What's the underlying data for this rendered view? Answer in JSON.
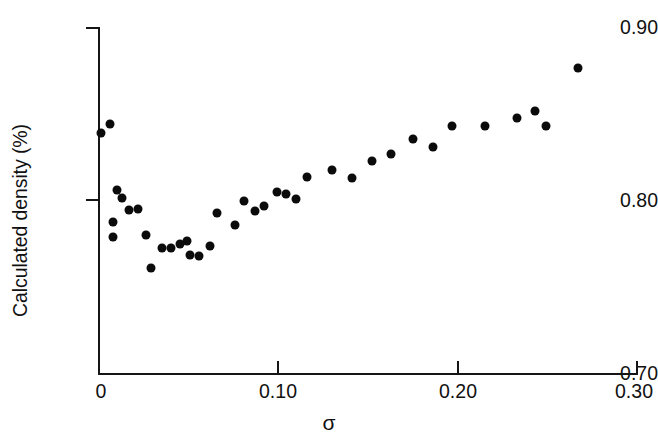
{
  "chart_data": {
    "type": "scatter",
    "title": "",
    "xlabel": "σ",
    "ylabel": "Calculated density (%)",
    "xlim": [
      0,
      0.3
    ],
    "ylim": [
      0.7,
      0.9
    ],
    "xticks": [
      0,
      0.1,
      0.2,
      0.3
    ],
    "xtick_labels": [
      "0",
      "0.10",
      "0.20",
      "0.30"
    ],
    "yticks": [
      0.7,
      0.8,
      0.9
    ],
    "ytick_labels": [
      "0.70",
      "0.80",
      "0.90"
    ],
    "grid": false,
    "legend": null,
    "marker": "filled-circle",
    "marker_color": "#0b0b0b",
    "marker_size_px": 9,
    "series": [
      {
        "name": "Calculated density vs sigma",
        "points": [
          {
            "x": 0.001,
            "y": 0.839
          },
          {
            "x": 0.006,
            "y": 0.844
          },
          {
            "x": 0.01,
            "y": 0.806
          },
          {
            "x": 0.013,
            "y": 0.801
          },
          {
            "x": 0.008,
            "y": 0.787
          },
          {
            "x": 0.017,
            "y": 0.794
          },
          {
            "x": 0.022,
            "y": 0.795
          },
          {
            "x": 0.008,
            "y": 0.7785
          },
          {
            "x": 0.026,
            "y": 0.7795
          },
          {
            "x": 0.029,
            "y": 0.7605
          },
          {
            "x": 0.035,
            "y": 0.7725
          },
          {
            "x": 0.04,
            "y": 0.7725
          },
          {
            "x": 0.045,
            "y": 0.7745
          },
          {
            "x": 0.049,
            "y": 0.7765
          },
          {
            "x": 0.051,
            "y": 0.7685
          },
          {
            "x": 0.056,
            "y": 0.7675
          },
          {
            "x": 0.062,
            "y": 0.7735
          },
          {
            "x": 0.066,
            "y": 0.7925
          },
          {
            "x": 0.076,
            "y": 0.7855
          },
          {
            "x": 0.081,
            "y": 0.7995
          },
          {
            "x": 0.087,
            "y": 0.7935
          },
          {
            "x": 0.092,
            "y": 0.7965
          },
          {
            "x": 0.099,
            "y": 0.8045
          },
          {
            "x": 0.104,
            "y": 0.8035
          },
          {
            "x": 0.11,
            "y": 0.8005
          },
          {
            "x": 0.116,
            "y": 0.8135
          },
          {
            "x": 0.13,
            "y": 0.8175
          },
          {
            "x": 0.141,
            "y": 0.8125
          },
          {
            "x": 0.152,
            "y": 0.8225
          },
          {
            "x": 0.163,
            "y": 0.8265
          },
          {
            "x": 0.175,
            "y": 0.8355
          },
          {
            "x": 0.186,
            "y": 0.8305
          },
          {
            "x": 0.197,
            "y": 0.8425
          },
          {
            "x": 0.215,
            "y": 0.8425
          },
          {
            "x": 0.233,
            "y": 0.8475
          },
          {
            "x": 0.243,
            "y": 0.8515
          },
          {
            "x": 0.249,
            "y": 0.8425
          },
          {
            "x": 0.267,
            "y": 0.8765
          }
        ]
      }
    ]
  },
  "axes": {
    "ylabel": "Calculated density (%)",
    "xlabel": "σ",
    "ytick_labels": [
      "0.90",
      "0.80",
      "0.70"
    ],
    "xtick_labels": [
      "0",
      "0.10",
      "0.20",
      "0.30"
    ]
  }
}
